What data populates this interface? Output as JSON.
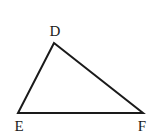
{
  "diagram": {
    "type": "triangle",
    "stroke_color": "#1a1a1a",
    "vertices": [
      {
        "name": "D",
        "x": 54,
        "y": 43,
        "label_x": 55,
        "label_y": 31
      },
      {
        "name": "E",
        "x": 18,
        "y": 113,
        "label_x": 19,
        "label_y": 126
      },
      {
        "name": "F",
        "x": 143,
        "y": 113,
        "label_x": 142,
        "label_y": 126
      }
    ],
    "labels": {
      "d": "D",
      "e": "E",
      "f": "F"
    }
  }
}
